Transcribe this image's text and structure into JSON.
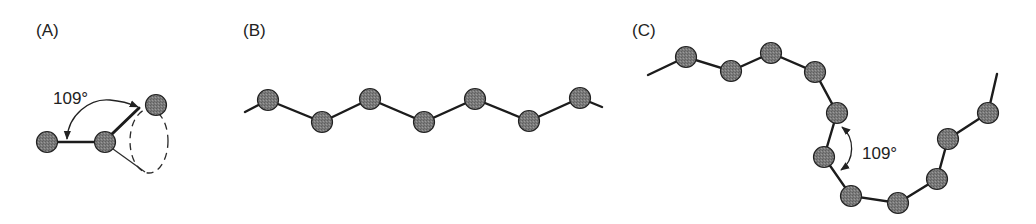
{
  "figure": {
    "colors": {
      "background": "#ffffff",
      "atom_fill": "#7a7a7a",
      "atom_outline": "#222222",
      "bond": "#1c1c1c",
      "text": "#222222"
    },
    "atom_radius": 10.5,
    "panels": [
      {
        "id": "A",
        "label": "(A)",
        "label_pos": [
          36,
          36
        ],
        "description": "Tetrahedral bond angle with rotational cone",
        "angle_label": "109°",
        "angle_label_pos": [
          53,
          104
        ],
        "atoms": [
          [
            47,
            142
          ],
          [
            105,
            142
          ],
          [
            156,
            105
          ]
        ],
        "bonds": [
          [
            [
              57,
              142
            ],
            [
              96,
              142
            ]
          ],
          [
            [
              112,
              134
            ],
            [
              139,
              108
            ]
          ]
        ],
        "thin_line": [
          [
            113,
            149
          ],
          [
            145,
            172
          ]
        ],
        "cone_ellipse": {
          "cx": 149,
          "cy": 141,
          "rx": 19,
          "ry": 32
        },
        "arc_path": "M 67 139 C 68 115, 90 98, 110 100 C 122 101, 131 104, 138 107"
      },
      {
        "id": "B",
        "label": "(B)",
        "label_pos": [
          243,
          36
        ],
        "description": "Fully extended zig-zag (all-trans) chain",
        "chain_start": [
          245,
          112
        ],
        "chain_end": [
          602,
          107
        ],
        "atoms": [
          [
            268,
            100
          ],
          [
            322,
            122
          ],
          [
            370,
            99
          ],
          [
            424,
            122
          ],
          [
            475,
            99
          ],
          [
            529,
            121
          ],
          [
            580,
            98
          ]
        ]
      },
      {
        "id": "C",
        "label": "(C)",
        "label_pos": [
          632,
          36
        ],
        "description": "Random-coil chain conformation",
        "angle_label": "109°",
        "angle_label_pos": [
          862,
          159
        ],
        "chain_start": [
          648,
          75
        ],
        "chain_end": [
          997,
          74
        ],
        "atoms": [
          [
            686,
            57
          ],
          [
            731,
            71
          ],
          [
            771,
            53
          ],
          [
            815,
            72
          ],
          [
            837,
            113
          ],
          [
            824,
            157
          ],
          [
            851,
            196
          ],
          [
            898,
            203
          ],
          [
            937,
            179
          ],
          [
            948,
            139
          ],
          [
            988,
            113
          ]
        ],
        "arc_path": "M 842 127 C 855 138, 855 160, 841 170"
      }
    ]
  }
}
